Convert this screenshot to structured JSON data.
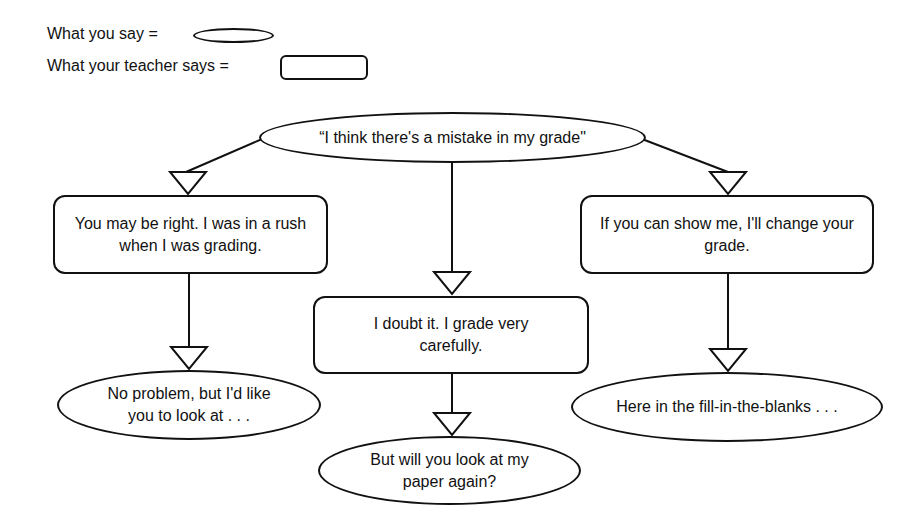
{
  "legend": {
    "student_label": "What you say =",
    "student_shape": "ellipse",
    "teacher_label": "What your teacher says =",
    "teacher_shape": "rounded-rectangle"
  },
  "diagram": {
    "root": {
      "speaker": "student",
      "text": "“I think there's a mistake in my grade\""
    },
    "branches": [
      {
        "teacher": {
          "text": "You may be right. I was in a rush when I was grading."
        },
        "student": {
          "text": "No problem, but I'd like you to look at . . ."
        }
      },
      {
        "teacher": {
          "text": "I doubt it. I grade very carefully."
        },
        "student": {
          "text": "But will you look at my paper again?"
        }
      },
      {
        "teacher": {
          "text": "If you can show me, I'll change your grade."
        },
        "student": {
          "text": "Here in the fill-in-the-blanks . . ."
        }
      }
    ],
    "colors": {
      "stroke": "#111111",
      "background": "#ffffff"
    }
  }
}
